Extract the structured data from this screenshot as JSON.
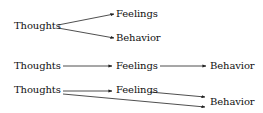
{
  "diagram": {
    "type": "cognitive-model-flow",
    "models": [
      {
        "id": "parallel",
        "nodes": {
          "thoughts": "Thoughts",
          "feelings": "Feelings",
          "behavior": "Behavior"
        },
        "edges": [
          [
            "Thoughts",
            "Feelings"
          ],
          [
            "Thoughts",
            "Behavior"
          ]
        ]
      },
      {
        "id": "sequential",
        "nodes": {
          "thoughts": "Thoughts",
          "feelings": "Feelings",
          "behavior": "Behavior"
        },
        "edges": [
          [
            "Thoughts",
            "Feelings"
          ],
          [
            "Feelings",
            "Behavior"
          ]
        ]
      },
      {
        "id": "combined",
        "nodes": {
          "thoughts": "Thoughts",
          "feelings": "Feelings",
          "behavior": "Behavior"
        },
        "edges": [
          [
            "Thoughts",
            "Feelings"
          ],
          [
            "Feelings",
            "Behavior"
          ],
          [
            "Thoughts",
            "Behavior"
          ]
        ]
      }
    ],
    "colors": {
      "line": "#222222",
      "text": "#111111",
      "background": "#ffffff"
    }
  }
}
